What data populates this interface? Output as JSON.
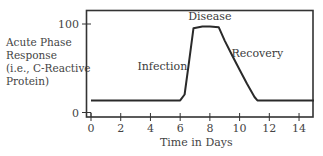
{
  "chart_data": {
    "type": "line",
    "title": "",
    "xlabel": "Time in Days",
    "ylabel": "Acute Phase Response (i.e., C-Reactive Protein)",
    "ylabel_lines": [
      "Acute Phase",
      "Response",
      "(i.e., C-Reactive",
      "Protein)"
    ],
    "xlim": [
      -0.3,
      15
    ],
    "ylim": [
      0,
      100
    ],
    "x_ticks": [
      0,
      2,
      4,
      6,
      8,
      10,
      12,
      14
    ],
    "y_ticks": [
      0,
      100
    ],
    "grid": false,
    "legend": null,
    "series": [
      {
        "name": "C-Reactive Protein",
        "x": [
          0,
          6,
          6.3,
          6.6,
          6.9,
          7.5,
          8.0,
          8.6,
          9.0,
          9.5,
          10.0,
          10.5,
          11.0,
          11.2,
          12,
          14,
          15
        ],
        "y": [
          8,
          8,
          15,
          55,
          95,
          97,
          97,
          96,
          80,
          62,
          45,
          28,
          12,
          8,
          8,
          8,
          8
        ]
      }
    ],
    "annotations": [
      {
        "text": "Infection",
        "x": 4.8,
        "y": 45
      },
      {
        "text": "Disease",
        "x": 8.0,
        "y": 105
      },
      {
        "text": "Recovery",
        "x": 11.2,
        "y": 60
      }
    ]
  }
}
